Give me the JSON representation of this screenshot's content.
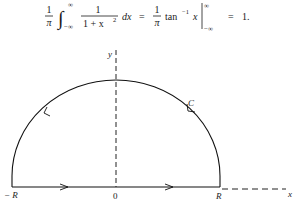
{
  "equation": {
    "coef_num": "1",
    "coef_den": "π",
    "integral_upper": "∞",
    "integral_lower": "−∞",
    "integrand_num": "1",
    "integrand_den": "1 + x",
    "integrand_den_exp": "2",
    "differential": "dx",
    "equals1": "=",
    "coef2_num": "1",
    "coef2_den": "π",
    "func": "tan",
    "func_exp": "−1",
    "func_arg": "x",
    "eval_upper": "∞",
    "eval_lower": "−∞",
    "equals2": "=",
    "result": "1."
  },
  "figure": {
    "y_axis_label": "y",
    "x_axis_label": "x",
    "contour_label": "C",
    "left_label": "− R",
    "origin_label": "0",
    "right_label": "R"
  }
}
